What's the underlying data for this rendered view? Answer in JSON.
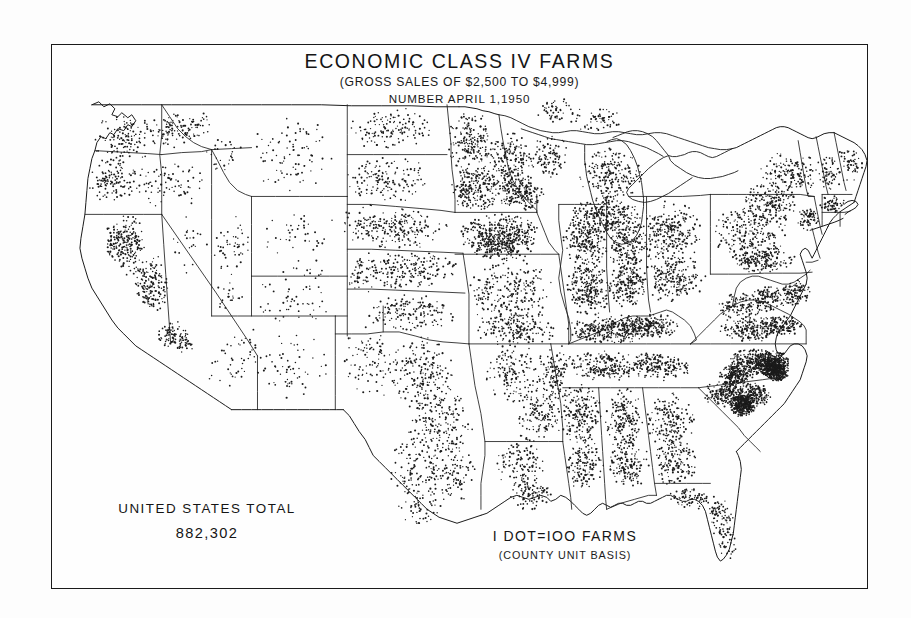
{
  "document": {
    "kind": "dot-density-map",
    "title": "ECONOMIC CLASS IV FARMS",
    "subtitle": "(GROSS SALES OF $2,500 TO $4,999)",
    "date_line": "NUMBER APRIL 1,1950"
  },
  "total": {
    "label": "UNITED STATES TOTAL",
    "value": "882,302"
  },
  "legend": {
    "main": "I DOT=IOO FARMS",
    "note": "(COUNTY UNIT BASIS)"
  },
  "colors": {
    "ink": "#1a1a1a",
    "paper": "#fdfdfd",
    "dot": "#1b1b1b"
  },
  "chart_data": {
    "type": "map",
    "map_type": "dot-density",
    "title": "ECONOMIC CLASS IV FARMS",
    "subtitle": "(GROSS SALES OF $2,500 TO $4,999)",
    "date": "April 1, 1950",
    "unit": "farms",
    "dot_value": 100,
    "dot_unit_basis": "county",
    "national_total": 882302,
    "region": "Conterminous United States",
    "density_regions": [
      {
        "name": "Eastern North Carolina coastal plain",
        "density": "very-high"
      },
      {
        "name": "South Carolina Pee Dee",
        "density": "very-high"
      },
      {
        "name": "Kentucky Bluegrass / tobacco belt",
        "density": "high"
      },
      {
        "name": "Corn Belt (Iowa, Illinois, Indiana)",
        "density": "high"
      },
      {
        "name": "Southern Wisconsin and Minnesota",
        "density": "high"
      },
      {
        "name": "Ohio and Pennsylvania",
        "density": "moderate-high"
      },
      {
        "name": "Mississippi Delta",
        "density": "moderate-high"
      },
      {
        "name": "Central Texas and Blackland Prairie",
        "density": "moderate"
      },
      {
        "name": "Central Valley of California",
        "density": "moderate"
      },
      {
        "name": "Great Plains (Kansas, Nebraska, Dakotas)",
        "density": "moderate"
      },
      {
        "name": "Mountain West (Nevada, Utah, Wyoming)",
        "density": "very-low"
      },
      {
        "name": "Florida peninsula",
        "density": "low"
      }
    ]
  }
}
